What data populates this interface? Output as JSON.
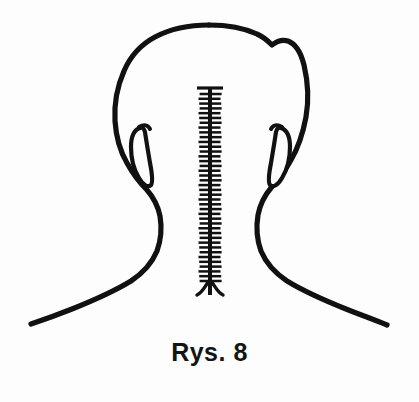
{
  "figure": {
    "caption": "Rys. 8",
    "title": "Rys. 8",
    "alt_description": "Line drawing of the back of a human head and neck with a vertical sutured incision along the midline",
    "background_color": "#fdfdfd",
    "ink_color": "#111111",
    "view": "posterior",
    "canvas": {
      "width": 419,
      "height": 402
    },
    "parts": {
      "head_outline_label": "head-outline",
      "left_ear_label": "left-ear",
      "right_ear_label": "right-ear",
      "neck_left_label": "neck-left",
      "neck_right_label": "neck-right",
      "shoulder_left_label": "shoulder-left",
      "shoulder_right_label": "shoulder-right",
      "suture_label": "midline-suture"
    },
    "suture": {
      "name": "midline-suture",
      "top_y": 88,
      "bottom_y": 295,
      "center_x": 210,
      "stitch_count": 40,
      "stitch_half_width": 11,
      "cap_half_width": 13,
      "fork_half_width": 13,
      "fork_depth": 14
    }
  }
}
